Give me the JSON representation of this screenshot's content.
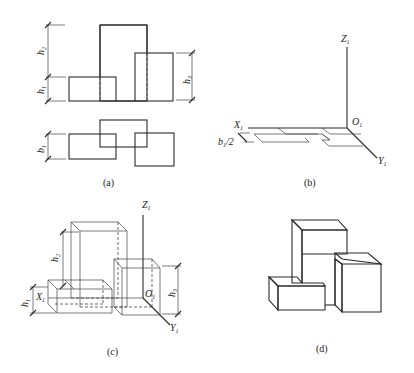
{
  "figure": {
    "panels": [
      {
        "id": "a",
        "caption": "(a)",
        "description": "Front view and top view of three blocks"
      },
      {
        "id": "b",
        "caption": "(b)",
        "description": "Axes X1, Y1, Z1 with top-view outline placed at origin O1"
      },
      {
        "id": "c",
        "caption": "(c)",
        "description": "Construction of the oblique/axonometric drawing with heights"
      },
      {
        "id": "d",
        "caption": "(d)",
        "description": "Finished axonometric drawing of three blocks"
      }
    ],
    "labels": {
      "h1": "h",
      "h1_sub": "1",
      "h2": "h",
      "h2_sub": "2",
      "h3": "h",
      "h3_sub": "3",
      "b1": "b",
      "b1_sub": "1",
      "b1_half": "b",
      "b1_half_sub": "1",
      "b1_half_tail": "/2",
      "X1": "X",
      "X1_sub": "1",
      "Y1": "Y",
      "Y1_sub": "1",
      "Z1": "Z",
      "Z1_sub": "1",
      "O1": "O",
      "O1_sub": "1"
    },
    "captions": {
      "a": "(a)",
      "b": "(b)",
      "c": "(c)",
      "d": "(d)"
    }
  }
}
